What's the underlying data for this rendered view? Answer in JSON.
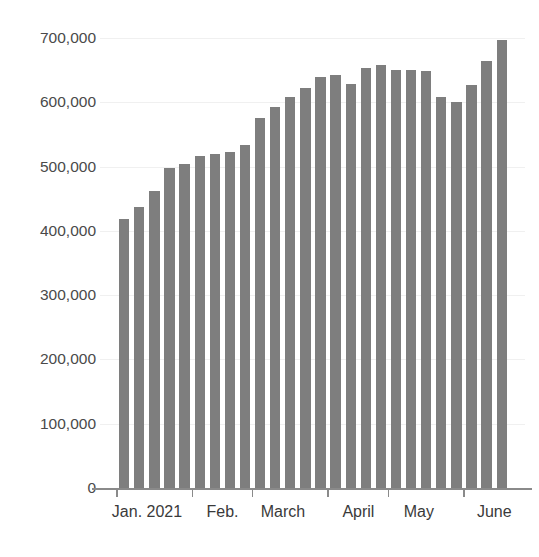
{
  "chart_data": {
    "type": "bar",
    "title": "",
    "subtitle": "",
    "xlabel": "",
    "ylabel": "",
    "ylim": [
      0,
      700000
    ],
    "grid": true,
    "legend": null,
    "bar_color": "#7e7e7e",
    "axis_color": "#8a8a8a",
    "y_ticks": [
      {
        "value": 700000,
        "label": "700,000"
      },
      {
        "value": 600000,
        "label": "600,000"
      },
      {
        "value": 500000,
        "label": "500,000"
      },
      {
        "value": 400000,
        "label": "400,000"
      },
      {
        "value": 300000,
        "label": "300,000"
      },
      {
        "value": 200000,
        "label": "200,000"
      },
      {
        "value": 100000,
        "label": "100,000"
      },
      {
        "value": 0,
        "label": "0"
      }
    ],
    "x_tick_labels": [
      "Jan. 2021",
      "Feb.",
      "March",
      "April",
      "May",
      "June"
    ],
    "categories": [
      "w1",
      "w2",
      "w3",
      "w4",
      "w5",
      "w6",
      "w7",
      "w8",
      "w9",
      "w10",
      "w11",
      "w12",
      "w13",
      "w14",
      "w15",
      "w16",
      "w17",
      "w18",
      "w19",
      "w20",
      "w21",
      "w22",
      "w23",
      "w24",
      "w25",
      "w26"
    ],
    "values": [
      418000,
      437000,
      462000,
      498000,
      504000,
      517000,
      519000,
      522000,
      533000,
      575000,
      592000,
      609000,
      622000,
      639000,
      643000,
      628000,
      653000,
      658000,
      650000,
      651000,
      648000,
      609000,
      601000,
      627000,
      665000,
      697000
    ]
  }
}
